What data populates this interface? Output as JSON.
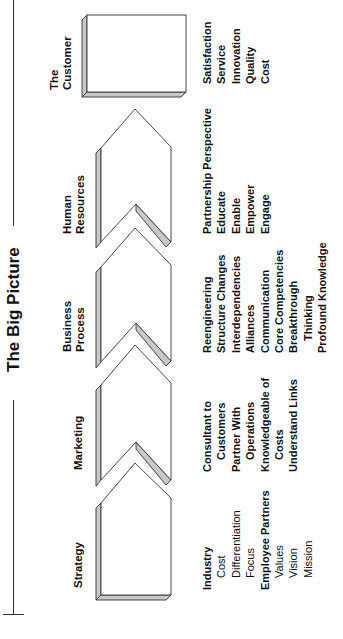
{
  "title": "The Big Picture",
  "colors": {
    "line": "#333333",
    "bevel": "#c8c8c8",
    "fill": "#ffffff"
  },
  "stages": [
    {
      "label_lines": [
        "Strategy"
      ],
      "items": [
        {
          "text": "Industry",
          "style": "bold"
        },
        {
          "text": "Cost",
          "style": "indent"
        },
        {
          "text": "Differentiation",
          "style": "indent"
        },
        {
          "text": "Focus",
          "style": "indent"
        },
        {
          "text": "Employee Partners",
          "style": "bold"
        },
        {
          "text": "Values",
          "style": "indent"
        },
        {
          "text": "Vision",
          "style": "indent"
        },
        {
          "text": "Mission",
          "style": "indent"
        }
      ]
    },
    {
      "label_lines": [
        "Marketing"
      ],
      "items": [
        {
          "text": "Consultant to",
          "style": "bold"
        },
        {
          "text": "Customers",
          "style": "bold-indent"
        },
        {
          "text": "Partner With",
          "style": "bold"
        },
        {
          "text": "Operations",
          "style": "bold-indent"
        },
        {
          "text": "Knowledgeable of",
          "style": "bold"
        },
        {
          "text": "Costs",
          "style": "bold-indent"
        },
        {
          "text": "Understand Links",
          "style": "bold"
        }
      ]
    },
    {
      "label_lines": [
        "Business",
        "Process"
      ],
      "items": [
        {
          "text": "Reengineering",
          "style": "bold"
        },
        {
          "text": "Structure Changes",
          "style": "bold"
        },
        {
          "text": "Interdependencies",
          "style": "bold"
        },
        {
          "text": "Alliances",
          "style": "bold"
        },
        {
          "text": "Communication",
          "style": "bold"
        },
        {
          "text": "Core Competencies",
          "style": "bold"
        },
        {
          "text": "Breakthrough",
          "style": "bold"
        },
        {
          "text": "Thinking",
          "style": "bold-indent"
        },
        {
          "text": "Profound Knowledge",
          "style": "bold"
        }
      ]
    },
    {
      "label_lines": [
        "Human",
        "Resources"
      ],
      "items": [
        {
          "text": "Partnership Perspective",
          "style": "bold"
        },
        {
          "text": "Educate",
          "style": "bold"
        },
        {
          "text": "Enable",
          "style": "bold"
        },
        {
          "text": "Empower",
          "style": "bold"
        },
        {
          "text": "Engage",
          "style": "bold"
        }
      ]
    },
    {
      "label_lines": [
        "The",
        "Customer"
      ],
      "items": [
        {
          "text": "Satisfaction",
          "style": "bold"
        },
        {
          "text": "Service",
          "style": "bold"
        },
        {
          "text": "Innovation",
          "style": "bold"
        },
        {
          "text": "Quality",
          "style": "bold"
        },
        {
          "text": "Cost",
          "style": "bold"
        }
      ]
    }
  ]
}
